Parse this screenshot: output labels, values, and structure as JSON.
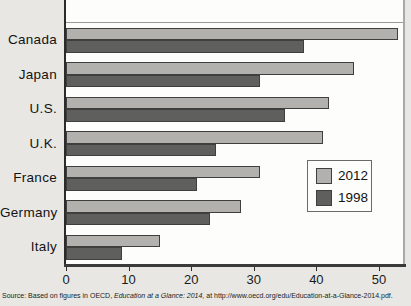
{
  "chart_data": {
    "type": "bar",
    "orientation": "horizontal",
    "title": "",
    "xlabel": "",
    "ylabel": "",
    "categories": [
      "Canada",
      "Japan",
      "U.S.",
      "U.K.",
      "France",
      "Germany",
      "Italy"
    ],
    "series": [
      {
        "name": "2012",
        "color": "#b3b1ad",
        "values": [
          53,
          46,
          42,
          41,
          31,
          28,
          15
        ]
      },
      {
        "name": "1998",
        "color": "#5f5f5e",
        "values": [
          38,
          31,
          35,
          24,
          21,
          23,
          9
        ]
      }
    ],
    "xlim": [
      0,
      54
    ],
    "xticks": [
      0,
      10,
      20,
      30,
      40,
      50
    ],
    "grid": false,
    "legend": {
      "position": "middle-right",
      "entries": [
        "2012",
        "1998"
      ]
    }
  },
  "source_note": {
    "prefix": "Source: Based on figures in OECD, ",
    "italic": "Education at a Glance: 2014,",
    "suffix": " at http://www.oecd.org/edu/Education-at-a-Glance-2014.pdf."
  },
  "colors": {
    "background": "#e8e7e3",
    "plot_background": "#fdfdfb",
    "axis": "#2b2b2b",
    "frame": "#9a9a98",
    "bar_2012": "#b3b1ad",
    "bar_1998": "#5f5f5e"
  }
}
